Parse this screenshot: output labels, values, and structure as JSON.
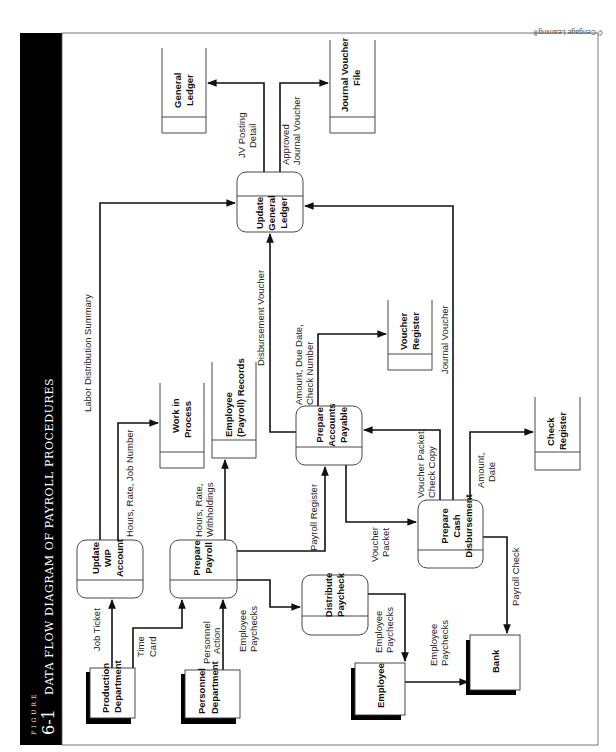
{
  "figure": {
    "label": "FIGURE",
    "number": "6-1",
    "title": "DATA FLOW DIAGRAM OF PAYROLL PROCEDURES",
    "credit": "© Cengage Learning®"
  },
  "entities": [
    {
      "id": "production",
      "lines": [
        "Production",
        "Department"
      ]
    },
    {
      "id": "personnel",
      "lines": [
        "Personnel",
        "Department"
      ]
    },
    {
      "id": "employee",
      "lines": [
        "Employee"
      ]
    },
    {
      "id": "bank",
      "lines": [
        "Bank"
      ]
    }
  ],
  "processes": [
    {
      "id": "update_wip",
      "lines": [
        "Update",
        "WIP",
        "Account"
      ]
    },
    {
      "id": "prepare_payroll",
      "lines": [
        "Prepare",
        "Payroll"
      ]
    },
    {
      "id": "distribute_paycheck",
      "lines": [
        "Distribute",
        "Paycheck"
      ]
    },
    {
      "id": "prepare_ap",
      "lines": [
        "Prepare",
        "Accounts",
        "Payable"
      ]
    },
    {
      "id": "prepare_cash",
      "lines": [
        "Prepare",
        "Cash",
        "Disbursement"
      ]
    },
    {
      "id": "update_gl",
      "lines": [
        "Update",
        "General",
        "Ledger"
      ]
    }
  ],
  "stores": [
    {
      "id": "wip",
      "lines": [
        "Work in",
        "Process"
      ]
    },
    {
      "id": "emp_records",
      "lines": [
        "Employee",
        "(Payroll) Records"
      ]
    },
    {
      "id": "voucher_register",
      "lines": [
        "Voucher",
        "Register"
      ]
    },
    {
      "id": "check_register",
      "lines": [
        "Check",
        "Register"
      ]
    },
    {
      "id": "general_ledger",
      "lines": [
        "General",
        "Ledger"
      ]
    },
    {
      "id": "jv_file",
      "lines": [
        "Journal Voucher",
        "File"
      ]
    }
  ],
  "flows": {
    "job_ticket": [
      "Job Ticket"
    ],
    "time_card": [
      "Time",
      "Card"
    ],
    "personnel_action": [
      "Personnel",
      "Action"
    ],
    "employee_paychecks_1": [
      "Employee",
      "Paychecks"
    ],
    "employee_paychecks_2": [
      "Employee",
      "Paychecks"
    ],
    "employee_paychecks_3": [
      "Employee",
      "Paychecks"
    ],
    "hours_rate_job": [
      "Hours, Rate, Job Number"
    ],
    "hours_rate_withholdings": [
      "Hours, Rate,",
      "Withholdings"
    ],
    "labor_distribution": [
      "Labor Distribution Summary"
    ],
    "payroll_register": [
      "Payroll Register"
    ],
    "voucher_packet": [
      "Voucher",
      "Packet"
    ],
    "disbursement_voucher": [
      "Disbursement Voucher"
    ],
    "amount_due_check": [
      "Amount, Due Date,",
      "Check Number"
    ],
    "voucher_packet_check_copy": [
      "Voucher Packet,",
      "Check Copy"
    ],
    "journal_voucher": [
      "Journal Voucher"
    ],
    "amount_date": [
      "Amount,",
      "Date"
    ],
    "payroll_check": [
      "Payroll Check"
    ],
    "jv_posting": [
      "JV Posting",
      "Detail"
    ],
    "approved_jv": [
      "Approved",
      "Journal Voucher"
    ]
  }
}
